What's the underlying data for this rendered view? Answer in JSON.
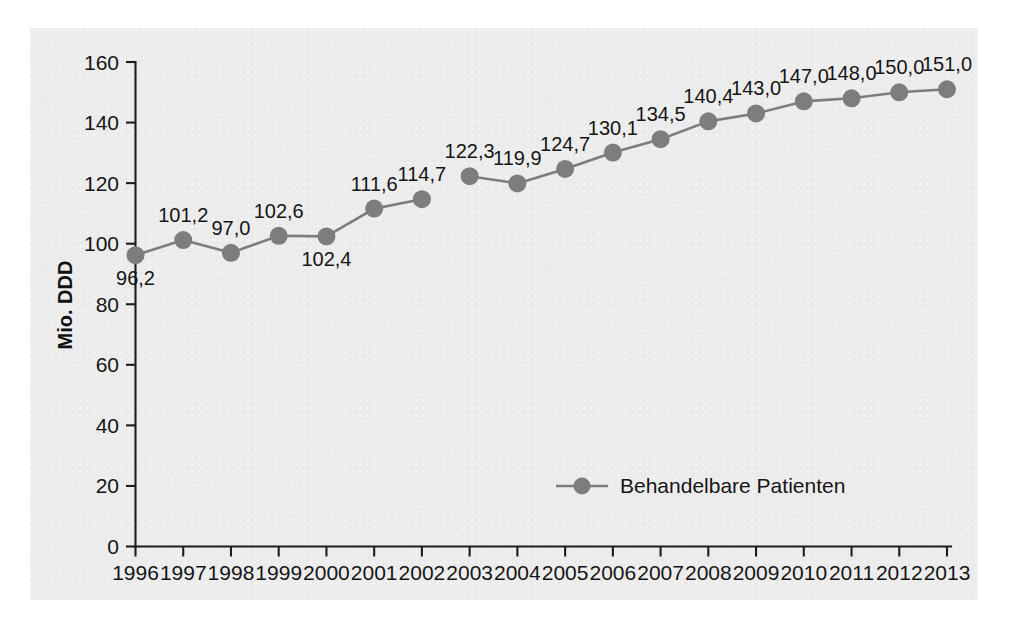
{
  "chart_data": {
    "type": "line",
    "title": "",
    "xlabel": "",
    "ylabel": "Mio. DDD",
    "ylim": [
      0,
      160
    ],
    "yticks": [
      0,
      20,
      40,
      60,
      80,
      100,
      120,
      140,
      160
    ],
    "ytick_labels": [
      "0",
      "20",
      "40",
      "60",
      "80",
      "100",
      "120",
      "140",
      "160"
    ],
    "grid": false,
    "legend_position": "inside-bottom-center",
    "categories": [
      "1996",
      "1997",
      "1998",
      "1999",
      "2000",
      "2001",
      "2002",
      "2003",
      "2004",
      "2005",
      "2006",
      "2007",
      "2008",
      "2009",
      "2010",
      "2011",
      "2012",
      "2013"
    ],
    "x": [
      1996,
      1997,
      1998,
      1999,
      2000,
      2001,
      2002,
      2003,
      2004,
      2005,
      2006,
      2007,
      2008,
      2009,
      2010,
      2011,
      2012,
      2013
    ],
    "series": [
      {
        "name": "Behandelbare Patienten",
        "color": "#7d7d7d",
        "values": [
          96.2,
          101.2,
          97.0,
          102.6,
          102.4,
          111.6,
          114.7,
          122.3,
          119.9,
          124.7,
          130.1,
          134.5,
          140.4,
          143.0,
          147.0,
          148.0,
          150.0,
          151.0
        ],
        "value_labels": [
          "96,2",
          "101,2",
          "97,0",
          "102,6",
          "102,4",
          "111,6",
          "114,7",
          "122,3",
          "119,9",
          "124,7",
          "130,1",
          "134,5",
          "140,4",
          "143,0",
          "147,0",
          "148,0",
          "150,0",
          "151,0"
        ],
        "label_positions": [
          "below",
          "above",
          "above",
          "above",
          "below",
          "above",
          "above",
          "above",
          "above",
          "above",
          "above",
          "above",
          "above",
          "above",
          "above",
          "above",
          "above",
          "above"
        ],
        "line_break_after_index": 6
      }
    ],
    "annotations": []
  },
  "legend": {
    "entries": [
      {
        "label": "Behandelbare Patienten",
        "color": "#7d7d7d",
        "marker": "circle"
      }
    ]
  },
  "axes": {
    "y_title": "Mio. DDD"
  },
  "colors": {
    "series": "#7d7d7d",
    "axis": "#1c1c1c",
    "text": "#151515",
    "panel_background": "#ececec",
    "page_background": "#ffffff"
  }
}
